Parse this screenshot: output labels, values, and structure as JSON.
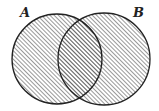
{
  "diagram": {
    "type": "venn",
    "shaded_region": "A ∪ B",
    "sets": [
      {
        "label": "A",
        "cx": 57,
        "cy": 59,
        "r": 45,
        "label_x": 20,
        "label_y": 6
      },
      {
        "label": "B",
        "cx": 104,
        "cy": 59,
        "r": 46,
        "label_x": 133,
        "label_y": 6
      }
    ],
    "colors": {
      "stroke": "#222222",
      "hatch": "#444444",
      "background": "#ffffff"
    },
    "hatch": {
      "direction": "diagonal-up-right",
      "spacing": 3
    }
  }
}
